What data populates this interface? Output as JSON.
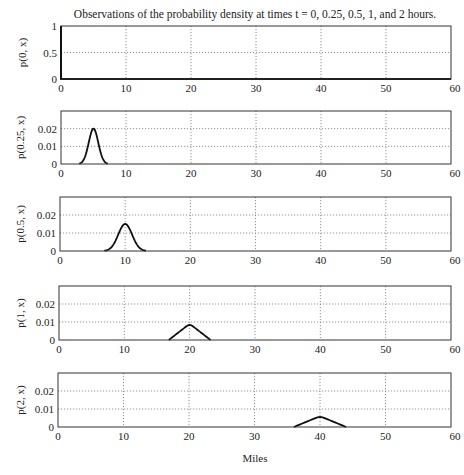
{
  "figure": {
    "title": "Observations of the probability density at times t = 0, 0.25, 0.5, 1, and 2 hours.",
    "xlabel": "Miles"
  },
  "chart_data": [
    {
      "type": "line",
      "title": "Observations of the probability density at times t = 0, 0.25, 0.5, 1, and 2 hours.",
      "xlabel": "",
      "ylabel": "p(0, x)",
      "xlim": [
        0,
        60
      ],
      "ylim": [
        0,
        1
      ],
      "xticks": [
        0,
        10,
        20,
        30,
        40,
        50,
        60
      ],
      "yticks": [
        0,
        0.5,
        1
      ],
      "ytick_labels": [
        "0",
        "0.5",
        "1"
      ],
      "grid": true,
      "series": [
        {
          "name": "p(0, x)",
          "x": [
            0,
            0,
            0,
            60
          ],
          "y": [
            0,
            1,
            0,
            0
          ],
          "note": "point mass at x=0"
        }
      ]
    },
    {
      "type": "line",
      "ylabel": "p(0.25, x)",
      "xlim": [
        0,
        60
      ],
      "ylim": [
        0,
        0.03
      ],
      "xticks": [
        0,
        10,
        20,
        30,
        40,
        50,
        60
      ],
      "yticks": [
        0,
        0.01,
        0.02
      ],
      "ytick_labels": [
        "0",
        "0.01",
        "0.02"
      ],
      "grid": true,
      "series": [
        {
          "name": "p(0.25, x)",
          "shape": "gaussian",
          "center": 5,
          "peak": 0.02,
          "support": [
            2.8,
            7.2
          ]
        }
      ]
    },
    {
      "type": "line",
      "ylabel": "p(0.5, x)",
      "xlim": [
        0,
        60
      ],
      "ylim": [
        0,
        0.03
      ],
      "xticks": [
        0,
        10,
        20,
        30,
        40,
        50,
        60
      ],
      "yticks": [
        0,
        0.01,
        0.02
      ],
      "ytick_labels": [
        "0",
        "0.01",
        "0.02"
      ],
      "grid": true,
      "series": [
        {
          "name": "p(0.5, x)",
          "shape": "gaussian",
          "center": 10,
          "peak": 0.015,
          "support": [
            6.8,
            13.2
          ]
        }
      ]
    },
    {
      "type": "line",
      "ylabel": "p(1, x)",
      "xlim": [
        0,
        60
      ],
      "ylim": [
        0,
        0.03
      ],
      "xticks": [
        0,
        10,
        20,
        30,
        40,
        50,
        60
      ],
      "yticks": [
        0,
        0.01,
        0.02
      ],
      "ytick_labels": [
        "0",
        "0.01",
        "0.02"
      ],
      "grid": true,
      "series": [
        {
          "name": "p(1, x)",
          "shape": "triangle",
          "center": 20,
          "peak": 0.009,
          "support": [
            16.8,
            23.2
          ]
        }
      ]
    },
    {
      "type": "line",
      "ylabel": "p(2, x)",
      "xlabel": "Miles",
      "xlim": [
        0,
        60
      ],
      "ylim": [
        0,
        0.03
      ],
      "xticks": [
        0,
        10,
        20,
        30,
        40,
        50,
        60
      ],
      "yticks": [
        0,
        0.01,
        0.02
      ],
      "ytick_labels": [
        "0",
        "0.01",
        "0.02"
      ],
      "grid": true,
      "series": [
        {
          "name": "p(2, x)",
          "shape": "triangle",
          "center": 40,
          "peak": 0.006,
          "support": [
            36,
            44
          ]
        }
      ]
    }
  ],
  "layout": {
    "panels": [
      {
        "left": 61,
        "right": 451,
        "top": 26,
        "bottom": 79
      },
      {
        "left": 61,
        "right": 451,
        "top": 111,
        "bottom": 164
      },
      {
        "left": 60,
        "right": 451,
        "top": 197,
        "bottom": 251
      },
      {
        "left": 59,
        "right": 451,
        "top": 286,
        "bottom": 340
      },
      {
        "left": 58,
        "right": 451,
        "top": 373,
        "bottom": 427
      }
    ]
  }
}
